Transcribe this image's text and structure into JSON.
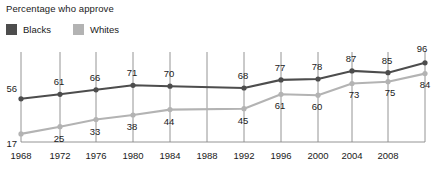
{
  "chart_data": {
    "type": "line",
    "title": "Percentage who approve",
    "xlabel": "",
    "ylabel": "",
    "ylim": [
      0,
      100
    ],
    "grid": "vertical",
    "legend_position": "top-left",
    "x": [
      1968,
      1972,
      1976,
      1980,
      1984,
      1992,
      1996,
      2000,
      2004,
      2008,
      2012
    ],
    "categories": [
      "1968",
      "1972",
      "1976",
      "1980",
      "1984",
      "1992",
      "1996",
      "2000",
      "2004",
      "2008",
      "2012"
    ],
    "axis_tick_labels": [
      "1968",
      "1972",
      "1976",
      "1980",
      "1984",
      "1988",
      "1992",
      "1996",
      "2000",
      "2004",
      "2008"
    ],
    "series": [
      {
        "name": "Blacks",
        "color": "#4d4d4d",
        "values": [
          56,
          61,
          66,
          71,
          70,
          68,
          77,
          78,
          87,
          85,
          96
        ]
      },
      {
        "name": "Whites",
        "color": "#b3b3b3",
        "values": [
          17,
          25,
          33,
          38,
          44,
          45,
          61,
          60,
          73,
          75,
          84
        ]
      }
    ]
  },
  "legend": {
    "items": [
      {
        "label": "Blacks",
        "color": "#4d4d4d"
      },
      {
        "label": "Whites",
        "color": "#b3b3b3"
      }
    ]
  }
}
